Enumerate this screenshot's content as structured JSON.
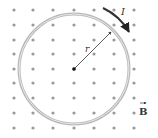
{
  "diagram": {
    "current_label": "I",
    "radius_label": "r",
    "field_label": "B",
    "field_direction": "out-of-page",
    "colors": {
      "dots": "#9a9a9a",
      "loop": "#b8b8b8",
      "loop_inner": "#e4e4e4",
      "arrow": "#333333",
      "text": "#333333"
    },
    "grid": {
      "columns": [
        14,
        33,
        53,
        74,
        94,
        114,
        134
      ],
      "rows": [
        10,
        25,
        40,
        54,
        69,
        83,
        98,
        113,
        128
      ]
    },
    "loop": {
      "cx": 74,
      "cy": 69,
      "r": 55
    }
  }
}
